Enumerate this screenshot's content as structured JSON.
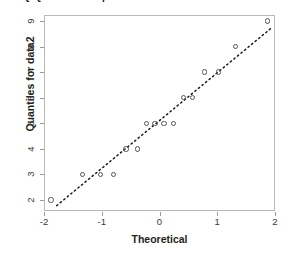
{
  "figure": {
    "title": "Q-Q Plot of Sample Data versus Standard Normal",
    "y_axis_title": "Quantiles for data2",
    "x_axis_title": "Theoretical"
  },
  "colors": {
    "frame": "#b9b9b9",
    "marker": "#555555",
    "reference_line": "#1a1a1a",
    "text": "#231f20",
    "tick_text": "#3a3a3a"
  },
  "chart_data": {
    "type": "scatter",
    "title": "Q-Q Plot of Sample Data versus Standard Normal",
    "xlabel": "Theoretical",
    "ylabel": "Quantiles for data2",
    "xlim": [
      -2,
      2
    ],
    "ylim": [
      1.75,
      9.2
    ],
    "xticks": [
      -2,
      -1,
      0,
      1,
      2
    ],
    "xticklabels": [
      "-2",
      "-1",
      "0",
      "1",
      "2"
    ],
    "yticks": [
      2,
      3,
      4,
      5,
      6,
      7,
      8,
      9
    ],
    "yticklabels": [
      "2",
      "3",
      "4",
      "5",
      "6",
      "7",
      "8",
      "9"
    ],
    "grid": false,
    "legend": false,
    "series": [
      {
        "name": "data2 quantiles",
        "marker": "open-circle",
        "x": [
          -1.88,
          -1.33,
          -1.02,
          -0.8,
          -0.58,
          -0.38,
          -0.22,
          -0.08,
          0.08,
          0.24,
          0.42,
          0.57,
          0.78,
          1.02,
          1.32,
          1.87
        ],
        "y": [
          2,
          3,
          3,
          3,
          4,
          4,
          5,
          5,
          5,
          5,
          6,
          6,
          7,
          7,
          8,
          9
        ]
      }
    ],
    "reference_line": {
      "style": "dotted",
      "x": [
        -1.78,
        1.95
      ],
      "y": [
        1.78,
        8.75
      ]
    }
  }
}
